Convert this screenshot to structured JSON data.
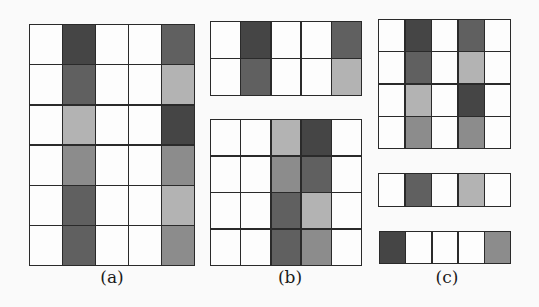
{
  "shade_colors": {
    "0": "#fdfdfd",
    "1": "#b3b3b3",
    "2": "#8c8c8c",
    "3": "#606060",
    "4": "#454545"
  },
  "panels": [
    {
      "id": "a",
      "label": "(a)",
      "label_x": 112,
      "grids": [
        {
          "x": 29,
          "y": 24,
          "w": 166,
          "h": 242,
          "cols": 5,
          "rows": 6,
          "cells": [
            [
              0,
              4,
              0,
              0,
              3
            ],
            [
              0,
              3,
              0,
              0,
              1
            ],
            [
              0,
              1,
              0,
              0,
              4
            ],
            [
              0,
              2,
              0,
              0,
              2
            ],
            [
              0,
              3,
              0,
              0,
              1
            ],
            [
              0,
              3,
              0,
              0,
              2
            ]
          ]
        }
      ]
    },
    {
      "id": "b",
      "label": "(b)",
      "label_x": 290,
      "grids": [
        {
          "x": 210,
          "y": 21,
          "w": 152,
          "h": 75,
          "cols": 5,
          "rows": 2,
          "cells": [
            [
              0,
              4,
              0,
              0,
              3
            ],
            [
              0,
              3,
              0,
              0,
              1
            ]
          ]
        },
        {
          "x": 210,
          "y": 119,
          "w": 152,
          "h": 147,
          "cols": 5,
          "rows": 4,
          "cells": [
            [
              0,
              0,
              1,
              4,
              0
            ],
            [
              0,
              0,
              2,
              3,
              0
            ],
            [
              0,
              0,
              3,
              1,
              0
            ],
            [
              0,
              0,
              3,
              2,
              0
            ]
          ]
        }
      ]
    },
    {
      "id": "c",
      "label": "(c)",
      "label_x": 447,
      "grids": [
        {
          "x": 378,
          "y": 19,
          "w": 133,
          "h": 130,
          "cols": 5,
          "rows": 4,
          "cells": [
            [
              0,
              4,
              0,
              3,
              0
            ],
            [
              0,
              3,
              0,
              1,
              0
            ],
            [
              0,
              1,
              0,
              4,
              0
            ],
            [
              0,
              2,
              0,
              2,
              0
            ]
          ]
        },
        {
          "x": 378,
          "y": 173,
          "w": 133,
          "h": 34,
          "cols": 5,
          "rows": 1,
          "cells": [
            [
              0,
              3,
              0,
              1,
              0
            ]
          ]
        },
        {
          "x": 379,
          "y": 231,
          "w": 132,
          "h": 33,
          "cols": 5,
          "rows": 1,
          "cells": [
            [
              4,
              0,
              0,
              0,
              2
            ]
          ]
        }
      ]
    }
  ]
}
